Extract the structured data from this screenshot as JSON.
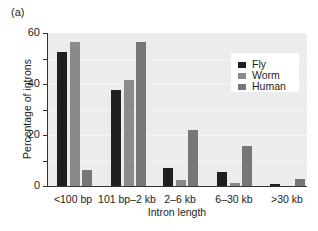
{
  "panel_label": "(a)",
  "colors": {
    "fly": "#1f1f1f",
    "worm": "#8a8a8a",
    "human": "#767676",
    "plot_background": "#ececec"
  },
  "chart_data": {
    "type": "bar",
    "title": "",
    "xlabel": "Intron length",
    "ylabel": "Percentage of introns",
    "ylim": [
      0,
      60
    ],
    "yticks": [
      0,
      20,
      40,
      60
    ],
    "grid": true,
    "legend_position": "upper right",
    "categories": [
      "<100 bp",
      "101 bp–2 kb",
      "2–6 kb",
      "6–30 kb",
      ">30 kb"
    ],
    "series": [
      {
        "name": "Fly",
        "values": [
          52.5,
          37.5,
          7.2,
          5.4,
          0.7
        ]
      },
      {
        "name": "Worm",
        "values": [
          56.5,
          41.5,
          2.4,
          1.3,
          0
        ]
      },
      {
        "name": "Human",
        "values": [
          6.3,
          56.5,
          22,
          15.7,
          2.7
        ]
      }
    ]
  }
}
